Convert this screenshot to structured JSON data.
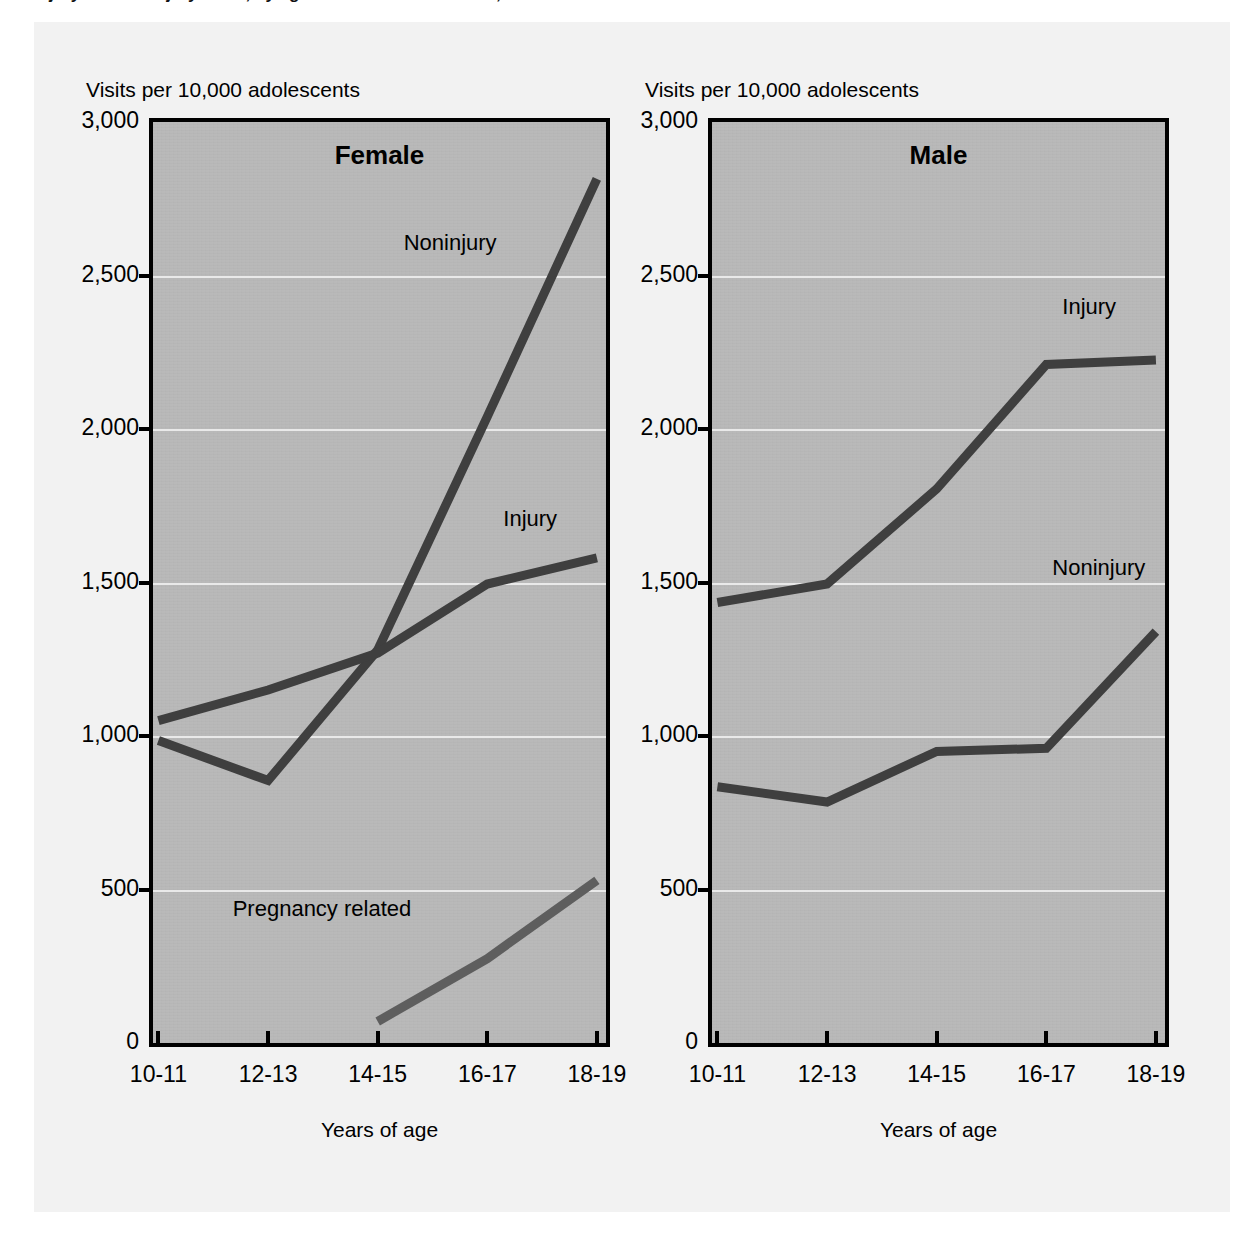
{
  "figure": {
    "title_clipped": "Injury and nonInjury visits, by age and sex: United States, 1997",
    "yaxis_caption": "Visits per 10,000 adolescents",
    "xaxis_title": "Years of age",
    "colors": {
      "plot_background": "#b9b9b9",
      "page_background": "#f2f2f2",
      "axis": "#000000",
      "gridline": "#e9e9e9",
      "line_dark": "#3f3f3f",
      "line_mid": "#5e5e5e"
    }
  },
  "chart_data": [
    {
      "type": "line",
      "title": "Female",
      "xlabel": "Years of age",
      "ylabel": "Visits per 10,000 adolescents",
      "categories": [
        "10-11",
        "12-13",
        "14-15",
        "16-17",
        "18-19"
      ],
      "ylim": [
        0,
        3000
      ],
      "yticks": [
        0,
        500,
        1000,
        1500,
        2000,
        2500,
        3000
      ],
      "ytick_labels": [
        "0",
        "500",
        "1,000",
        "1,500",
        "2,000",
        "2,500",
        "3,000"
      ],
      "grid": true,
      "legend": "inline-annotations",
      "series": [
        {
          "name": "Noninjury",
          "values": [
            985,
            855,
            1280,
            2040,
            2815
          ],
          "label_x_category": "14-15",
          "label_value": 2600
        },
        {
          "name": "Injury",
          "values": [
            1050,
            1150,
            1270,
            1495,
            1580
          ],
          "label_x_category": "16-17",
          "label_value": 1700
        },
        {
          "name": "Pregnancy related",
          "values": [
            null,
            null,
            70,
            275,
            530
          ],
          "label_x_category": "14-15",
          "label_value": 430
        }
      ]
    },
    {
      "type": "line",
      "title": "Male",
      "xlabel": "Years of age",
      "ylabel": "Visits per 10,000 adolescents",
      "categories": [
        "10-11",
        "12-13",
        "14-15",
        "16-17",
        "18-19"
      ],
      "ylim": [
        0,
        3000
      ],
      "yticks": [
        0,
        500,
        1000,
        1500,
        2000,
        2500,
        3000
      ],
      "ytick_labels": [
        "0",
        "500",
        "1,000",
        "1,500",
        "2,000",
        "2,500",
        "3,000"
      ],
      "grid": true,
      "legend": "inline-annotations",
      "series": [
        {
          "name": "Injury",
          "values": [
            1435,
            1495,
            1805,
            2210,
            2225
          ],
          "label_x_category": "16-17",
          "label_value": 2390
        },
        {
          "name": "Noninjury",
          "values": [
            835,
            785,
            950,
            960,
            1340
          ],
          "label_x_category": "16-17",
          "label_value": 1540
        }
      ]
    }
  ]
}
